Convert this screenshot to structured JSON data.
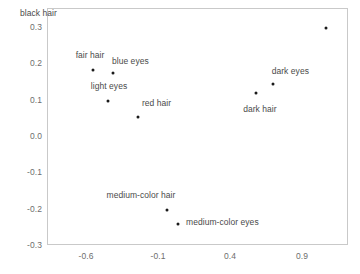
{
  "chart_data": {
    "type": "scatter",
    "title": "",
    "subtitle": "",
    "xlabel": "",
    "ylabel": "",
    "xlim": [
      -0.85,
      1.24
    ],
    "ylim": [
      -0.33,
      0.345
    ],
    "grid": false,
    "legend": "none",
    "xticks": [
      "-0.6",
      "-0.1",
      "0.4",
      "0.9"
    ],
    "xtick_values": [
      -0.6,
      -0.1,
      0.4,
      0.9
    ],
    "yticks": [
      "0.3",
      "0.2",
      "0.1",
      "0.0",
      "-0.1",
      "-0.2",
      "-0.3"
    ],
    "ytick_values": [
      0.3,
      0.2,
      0.1,
      0.0,
      -0.1,
      -0.2,
      -0.3
    ],
    "point_color": "#1a1a1a",
    "label_color": "#4a4a4a",
    "axis_color": "#c9c9c9",
    "points": [
      {
        "label": "black hair",
        "x": 1.07,
        "y": 0.297,
        "label_dx": -2,
        "label_dy": 0.042
      },
      {
        "label": "fair hair",
        "x": -0.552,
        "y": 0.182,
        "label_dx": -0.02,
        "label_dy": 0.042
      },
      {
        "label": "blue eyes",
        "x": -0.412,
        "y": 0.173,
        "label_dx": 0.12,
        "label_dy": 0.033
      },
      {
        "label": "dark eyes",
        "x": 0.699,
        "y": 0.142,
        "label_dx": 0.12,
        "label_dy": 0.037
      },
      {
        "label": "dark hair",
        "x": 0.578,
        "y": 0.118,
        "label_dx": 0.03,
        "label_dy": -0.043
      },
      {
        "label": "light eyes",
        "x": -0.45,
        "y": 0.095,
        "label_dx": 0.01,
        "label_dy": 0.042
      },
      {
        "label": "red hair",
        "x": -0.24,
        "y": 0.052,
        "label_dx": 0.13,
        "label_dy": 0.039
      },
      {
        "label": "medium-color hair",
        "x": -0.038,
        "y": -0.203,
        "label_dx": -0.18,
        "label_dy": 0.041
      },
      {
        "label": "medium-color eyes",
        "x": 0.037,
        "y": -0.243,
        "label_dx": 0.31,
        "label_dy": 0.006
      }
    ]
  }
}
